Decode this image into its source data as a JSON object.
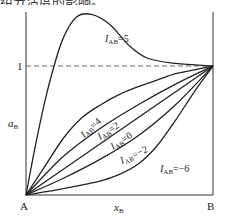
{
  "header": {
    "cut_text": "组分活度的影响。"
  },
  "chart_data": {
    "type": "line",
    "title": "",
    "xlabel": "x_B",
    "ylabel": "a_B",
    "x_range": [
      0,
      1
    ],
    "y_range": [
      0,
      1.55
    ],
    "x_tick_labels": [
      "A",
      "B"
    ],
    "y_tick_labels": [
      "1"
    ],
    "reference_line": {
      "y": 1,
      "style": "dashed"
    },
    "grid": false,
    "legend": "inline labels on curves",
    "series": [
      {
        "name": "I_AB=5",
        "label_main": "I",
        "label_sub": "AB",
        "label_val": "=5",
        "x": [
          0,
          0.05,
          0.1,
          0.15,
          0.2,
          0.27,
          0.35,
          0.45,
          0.55,
          0.65,
          0.8,
          1.0
        ],
        "y": [
          0,
          0.38,
          0.72,
          1.0,
          1.22,
          1.38,
          1.4,
          1.32,
          1.16,
          1.06,
          1.02,
          1.0
        ]
      },
      {
        "name": "I_AB=4",
        "label_main": "I",
        "label_sub": "AB",
        "label_val": "=4",
        "x": [
          0,
          0.1,
          0.2,
          0.3,
          0.4,
          0.5,
          0.6,
          0.7,
          0.8,
          0.9,
          1.0
        ],
        "y": [
          0,
          0.22,
          0.44,
          0.6,
          0.7,
          0.78,
          0.84,
          0.89,
          0.94,
          0.97,
          1.0
        ]
      },
      {
        "name": "I_AB=2",
        "label_main": "I",
        "label_sub": "AB",
        "label_val": "=2",
        "x": [
          0,
          0.2,
          0.4,
          0.6,
          0.8,
          1.0
        ],
        "y": [
          0,
          0.3,
          0.52,
          0.7,
          0.86,
          1.0
        ]
      },
      {
        "name": "I_AB=0",
        "label_main": "I",
        "label_sub": "AB",
        "label_val": "=0",
        "x": [
          0,
          1.0
        ],
        "y": [
          0,
          1.0
        ]
      },
      {
        "name": "I_AB=-2",
        "label_main": "I",
        "label_sub": "AB",
        "label_val": "=−2",
        "x": [
          0,
          0.2,
          0.4,
          0.6,
          0.8,
          1.0
        ],
        "y": [
          0,
          0.13,
          0.28,
          0.46,
          0.7,
          1.0
        ]
      },
      {
        "name": "I_AB=-6",
        "label_main": "I",
        "label_sub": "AB",
        "label_val": "=−6",
        "x": [
          0,
          0.2,
          0.4,
          0.5,
          0.6,
          0.7,
          0.8,
          0.9,
          1.0
        ],
        "y": [
          0,
          0.05,
          0.11,
          0.16,
          0.24,
          0.38,
          0.58,
          0.8,
          1.0
        ]
      }
    ]
  },
  "labels": {
    "y_axis": "a",
    "y_axis_sub": "B",
    "x_axis": "x",
    "x_axis_sub": "B",
    "origin": "A",
    "end": "B",
    "one": "1"
  }
}
